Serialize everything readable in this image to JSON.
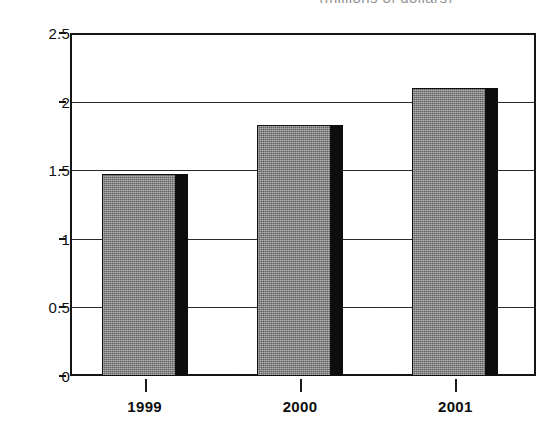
{
  "chart_data": {
    "type": "bar",
    "title": "",
    "clipped_caption": "(millions of dollars)",
    "xlabel": "",
    "ylabel": "",
    "categories": [
      "1999",
      "2000",
      "2001"
    ],
    "values": [
      1.47,
      1.83,
      2.1
    ],
    "series": [
      {
        "name": "Amount",
        "values": [
          1.47,
          1.83,
          2.1
        ]
      }
    ],
    "ylim": [
      0,
      2.5
    ],
    "ytick_labels": [
      "2.5",
      "2",
      "1.5",
      "1",
      "0.5",
      "0"
    ],
    "ytick_values": [
      2.5,
      2,
      1.5,
      1,
      0.5,
      0
    ],
    "grid": true,
    "grid_axis": "y",
    "legend": false,
    "legend_position": "none",
    "bar_fill_color": "#878787",
    "bar_edge_color": "#101010",
    "bar_shadow_color": "#0d0d0d",
    "axis_color": "#151515",
    "background_color": "#ffffff"
  },
  "axes": {
    "y_ticks": [
      {
        "label": "2.5",
        "value": 2.5
      },
      {
        "label": "2",
        "value": 2
      },
      {
        "label": "1.5",
        "value": 1.5
      },
      {
        "label": "1",
        "value": 1
      },
      {
        "label": "0.5",
        "value": 0.5
      },
      {
        "label": "0",
        "value": 0
      }
    ],
    "x_ticks": [
      {
        "label": "1999"
      },
      {
        "label": "2000"
      },
      {
        "label": "2001"
      }
    ]
  }
}
